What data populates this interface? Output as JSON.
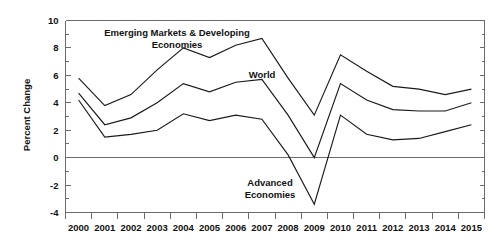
{
  "chart_data": {
    "type": "line",
    "title": "",
    "subtitle": "",
    "xlabel": "",
    "ylabel": "Percent Change",
    "categories": [
      "2000",
      "2001",
      "2002",
      "2003",
      "2004",
      "2005",
      "2006",
      "2007",
      "2008",
      "2009",
      "2010",
      "2011",
      "2012",
      "2013",
      "2014",
      "2015"
    ],
    "x": [
      2000,
      2001,
      2002,
      2003,
      2004,
      2005,
      2006,
      2007,
      2008,
      2009,
      2010,
      2011,
      2012,
      2013,
      2014,
      2015
    ],
    "ylim": [
      -4,
      10
    ],
    "yticks": [
      -4,
      -2,
      0,
      2,
      4,
      6,
      8,
      10
    ],
    "ytick_labels": [
      "-4",
      "-2",
      "0",
      "2",
      "4",
      "6",
      "8",
      "10"
    ],
    "yminor_step": 1,
    "grid": false,
    "zero_line": true,
    "legend_position": "inline-annotations",
    "series": [
      {
        "name": "Emerging Markets & Developing Economies",
        "values": [
          5.8,
          3.8,
          4.6,
          6.4,
          8.0,
          7.3,
          8.2,
          8.7,
          5.8,
          3.1,
          7.5,
          6.3,
          5.2,
          5.0,
          4.6,
          5.0
        ]
      },
      {
        "name": "World",
        "values": [
          4.7,
          2.4,
          2.9,
          4.0,
          5.4,
          4.8,
          5.5,
          5.7,
          3.1,
          0.0,
          5.4,
          4.2,
          3.5,
          3.4,
          3.4,
          4.0
        ]
      },
      {
        "name": "Advanced Economies",
        "values": [
          4.2,
          1.5,
          1.7,
          2.0,
          3.2,
          2.7,
          3.1,
          2.8,
          0.2,
          -3.4,
          3.1,
          1.7,
          1.3,
          1.4,
          1.9,
          2.4
        ]
      }
    ],
    "annotations": [
      {
        "id": "emerging-markets-label",
        "text_line1": "Emerging Markets & Developing",
        "text_line2": "Economies",
        "x_px": 177,
        "y_px": 36
      },
      {
        "id": "world-label",
        "text_line1": "World",
        "text_line2": "",
        "x_px": 262,
        "y_px": 78
      },
      {
        "id": "advanced-economies-label",
        "text_line1": "Advanced",
        "text_line2": "Economies",
        "x_px": 270,
        "y_px": 186
      }
    ],
    "colors": {
      "line": "#1a1a1a",
      "axis": "#6b6b6b",
      "background": "#ffffff",
      "text": "#111111"
    }
  }
}
